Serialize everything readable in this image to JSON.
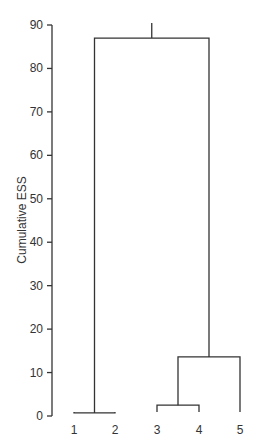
{
  "chart_data": {
    "type": "dendrogram",
    "title": "",
    "xlabel": "",
    "ylabel": "Cumulative ESS",
    "ylim": [
      0,
      90
    ],
    "yticks": [
      0,
      10,
      20,
      30,
      40,
      50,
      60,
      70,
      80,
      90
    ],
    "leaves": [
      "1",
      "2",
      "3",
      "4",
      "5"
    ],
    "merges": [
      {
        "left": "1",
        "right": "2",
        "height": 0.7
      },
      {
        "left": "3",
        "right": "4",
        "height": 2.5
      },
      {
        "left": "(3,4)",
        "right": "5",
        "height": 13.6
      },
      {
        "left": "(1,2)",
        "right": "((3,4),5)",
        "height": 87
      }
    ],
    "grid": false,
    "legend": null
  }
}
